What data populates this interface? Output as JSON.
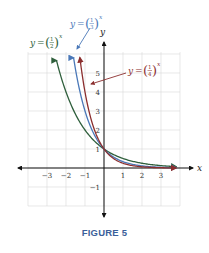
{
  "chart_data": {
    "type": "line",
    "title": "",
    "caption": "FIGURE 5",
    "xlabel": "x",
    "ylabel": "y",
    "xlim": [
      -4,
      4
    ],
    "ylim": [
      -2,
      6
    ],
    "grid": true,
    "x_ticks": [
      "−3",
      "−2",
      "−1",
      "1",
      "2",
      "3"
    ],
    "x_tick_values": [
      -3,
      -2,
      -1,
      1,
      2,
      3
    ],
    "y_ticks": [
      "5",
      "4",
      "3",
      "2",
      "1",
      "−1"
    ],
    "y_tick_values": [
      5,
      4,
      3,
      2,
      1,
      -1
    ],
    "series": [
      {
        "name": "y = (1/2)^x",
        "base": 0.5,
        "color": "#2f5f3c",
        "label": {
          "prefix": "y = (",
          "num": "1",
          "den": "2",
          "suffix": ")",
          "exp": "x"
        },
        "x_start": -2.5
      },
      {
        "name": "y = (1/3)^x",
        "base": 0.3333,
        "color": "#4a78b8",
        "label": {
          "prefix": "y = (",
          "num": "1",
          "den": "3",
          "suffix": ")",
          "exp": "x"
        },
        "x_start": -1.6
      },
      {
        "name": "y = (1/4)^x",
        "base": 0.25,
        "color": "#8b2e2e",
        "label": {
          "prefix": "y = (",
          "num": "1",
          "den": "4",
          "suffix": ")",
          "exp": "x"
        },
        "x_start": -1.27
      }
    ],
    "annotations": [
      "y = (1/2)^x",
      "y = (1/3)^x",
      "y = (1/4)^x"
    ],
    "point_of_intersection": [
      0,
      1
    ]
  },
  "figure": {
    "caption": "FIGURE 5",
    "x_axis_label": "x",
    "y_axis_label": "y",
    "labels": {
      "half": {
        "lhs": "y = ",
        "num": "1",
        "den": "2",
        "exp": "x"
      },
      "third": {
        "lhs": "y = ",
        "num": "1",
        "den": "3",
        "exp": "x"
      },
      "quarter": {
        "lhs": "y = ",
        "num": "1",
        "den": "4",
        "exp": "x"
      }
    },
    "colors": {
      "half": "#2f5f3c",
      "third": "#4a78b8",
      "quarter": "#8b2e2e",
      "grid": "#d9d9d9",
      "axis": "#111111",
      "caption": "#3b5f9a"
    }
  }
}
